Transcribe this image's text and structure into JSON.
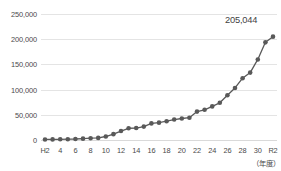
{
  "chart_data": {
    "type": "line",
    "title": "",
    "subtitle": "",
    "xlabel": "（年度）",
    "ylabel": "",
    "grid": true,
    "legend": false,
    "ylim": [
      0,
      250000
    ],
    "ytick_values": [
      0,
      50000,
      100000,
      150000,
      200000,
      250000
    ],
    "ytick_labels": [
      "0",
      "50,000",
      "100,000",
      "150,000",
      "200,000",
      "250,000"
    ],
    "x_tick_labels": [
      "H2",
      "4",
      "6",
      "8",
      "10",
      "12",
      "14",
      "16",
      "18",
      "20",
      "22",
      "24",
      "26",
      "28",
      "30",
      "R2"
    ],
    "categories": [
      "H2",
      "H3",
      "H4",
      "H5",
      "H6",
      "H7",
      "H8",
      "H9",
      "H10",
      "H11",
      "H12",
      "H13",
      "H14",
      "H15",
      "H16",
      "H17",
      "H18",
      "H19",
      "H20",
      "H21",
      "H22",
      "H23",
      "H24",
      "H25",
      "H26",
      "H27",
      "H28",
      "H29",
      "H30",
      "R1",
      "R2"
    ],
    "series": [
      {
        "name": "件数",
        "color": "#595959",
        "marker": "circle",
        "values": [
          1101,
          1210,
          1372,
          1611,
          1961,
          2722,
          3598,
          4151,
          6932,
          11631,
          17725,
          23274,
          23738,
          26569,
          32979,
          34472,
          37323,
          40639,
          42664,
          44211,
          56384,
          59919,
          66701,
          73765,
          88931,
          103260,
          122575,
          133778,
          159838,
          193780,
          205044
        ]
      }
    ],
    "annotations": [
      {
        "text": "205,044",
        "attached_to": "R2",
        "value": 205044
      }
    ]
  }
}
